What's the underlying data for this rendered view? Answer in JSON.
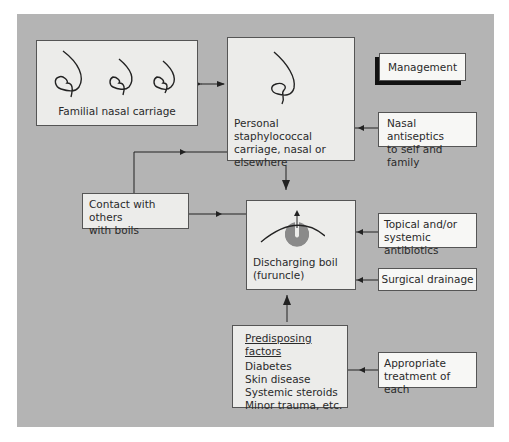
{
  "diagram": {
    "title_box": "Management",
    "familial": {
      "label": "Familial nasal carriage",
      "icon": "nose-profile-icon"
    },
    "personal": {
      "lines": [
        "Personal staphylococcal",
        "carriage, nasal or",
        "elsewhere"
      ],
      "icon": "nose-profile-icon"
    },
    "nasal_antiseptics": {
      "lines": [
        "Nasal antiseptics",
        "to self and family"
      ]
    },
    "contact": {
      "lines": [
        "Contact with others",
        "with boils"
      ]
    },
    "boil": {
      "lines": [
        "Discharging boil",
        "(furuncle)"
      ],
      "icon": "boil-cross-section-icon"
    },
    "topical": {
      "lines": [
        "Topical and/or",
        "systemic antibiotics"
      ]
    },
    "surgical": {
      "label": "Surgical drainage"
    },
    "predisposing": {
      "heading": "Predisposing factors",
      "items": [
        "Diabetes",
        "Skin disease",
        "Systemic steroids",
        "Minor trauma, etc."
      ]
    },
    "appropriate": {
      "lines": [
        "Appropriate",
        "treatment of each"
      ]
    },
    "colors": {
      "panel": "#b4b4b4",
      "box": "#ececea",
      "white_box": "#f7f7f5",
      "boil": "#8a8a8a",
      "shadow": "#111111"
    }
  }
}
